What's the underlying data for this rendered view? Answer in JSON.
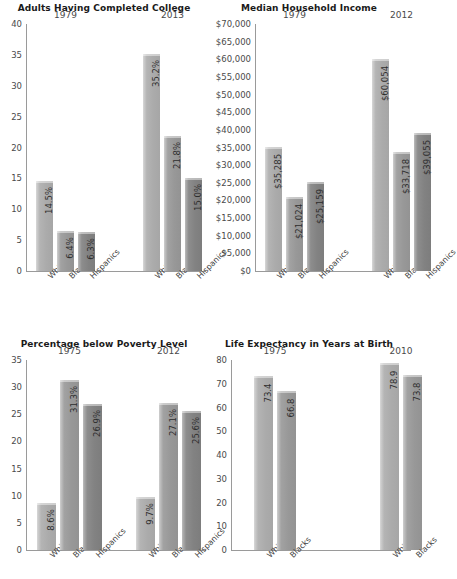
{
  "figure": {
    "background": "#ffffff",
    "series_colors": {
      "Whites": "#b4b4b4",
      "Blacks": "#a2a2a2",
      "Hispanics": "#8d8d8d"
    }
  },
  "chart_data": [
    {
      "type": "bar",
      "title": "Adults Having Completed College",
      "xlabel": "",
      "ylabel": "",
      "ylim": [
        0,
        40
      ],
      "yticks": [
        "0",
        "5",
        "10",
        "15",
        "20",
        "25",
        "30",
        "35",
        "40"
      ],
      "ytick_values": [
        0,
        5,
        10,
        15,
        20,
        25,
        30,
        35,
        40
      ],
      "grid": false,
      "legend": "none",
      "groups": [
        "1979",
        "2013"
      ],
      "categories": [
        "Whites",
        "Blacks",
        "Hispanics"
      ],
      "series": [
        {
          "name": "1979",
          "values": [
            14.5,
            6.4,
            6.3
          ],
          "labels": [
            "14.5%",
            "6.4%",
            "6.3%"
          ]
        },
        {
          "name": "2013",
          "values": [
            35.2,
            21.8,
            15.0
          ],
          "labels": [
            "35.2%",
            "21.8%",
            "15.0%"
          ]
        }
      ]
    },
    {
      "type": "bar",
      "title": "Median Household Income",
      "xlabel": "",
      "ylabel": "",
      "ylim": [
        0,
        70000
      ],
      "yticks": [
        "$0",
        "$5,000",
        "$10,000",
        "$15,000",
        "$20,000",
        "$25,000",
        "$30,000",
        "$35,000",
        "$40,000",
        "$45,000",
        "$50,000",
        "$55,000",
        "$60,000",
        "$65,000",
        "$70,000"
      ],
      "ytick_values": [
        0,
        5000,
        10000,
        15000,
        20000,
        25000,
        30000,
        35000,
        40000,
        45000,
        50000,
        55000,
        60000,
        65000,
        70000
      ],
      "grid": false,
      "legend": "none",
      "groups": [
        "1979",
        "2012"
      ],
      "categories": [
        "Whites",
        "Blacks",
        "Hispanics"
      ],
      "series": [
        {
          "name": "1979",
          "values": [
            35285,
            21024,
            25159
          ],
          "labels": [
            "$35,285",
            "$21,024",
            "$25,159"
          ]
        },
        {
          "name": "2012",
          "values": [
            60054,
            33718,
            39055
          ],
          "labels": [
            "$60,054",
            "$33,718",
            "$39,055"
          ]
        }
      ]
    },
    {
      "type": "bar",
      "title": "Percentage below Poverty Level",
      "xlabel": "",
      "ylabel": "",
      "ylim": [
        0,
        35
      ],
      "yticks": [
        "0",
        "5",
        "10",
        "15",
        "20",
        "25",
        "30",
        "35"
      ],
      "ytick_values": [
        0,
        5,
        10,
        15,
        20,
        25,
        30,
        35
      ],
      "grid": false,
      "legend": "none",
      "groups": [
        "1975",
        "2012"
      ],
      "categories": [
        "Whites",
        "Blacks",
        "Hispanics"
      ],
      "series": [
        {
          "name": "1975",
          "values": [
            8.6,
            31.3,
            26.9
          ],
          "labels": [
            "8.6%",
            "31.3%",
            "26.9%"
          ]
        },
        {
          "name": "2012",
          "values": [
            9.7,
            27.1,
            25.6
          ],
          "labels": [
            "9.7%",
            "27.1%",
            "25.6%"
          ]
        }
      ]
    },
    {
      "type": "bar",
      "title": "Life Expectancy in Years at Birth",
      "xlabel": "",
      "ylabel": "",
      "ylim": [
        0,
        80
      ],
      "yticks": [
        "0",
        "10",
        "20",
        "30",
        "40",
        "50",
        "60",
        "70",
        "80"
      ],
      "ytick_values": [
        0,
        10,
        20,
        30,
        40,
        50,
        60,
        70,
        80
      ],
      "grid": false,
      "legend": "none",
      "groups": [
        "1975",
        "2010"
      ],
      "categories": [
        "Whites",
        "Blacks"
      ],
      "series": [
        {
          "name": "1975",
          "values": [
            73.4,
            66.8
          ],
          "labels": [
            "73.4",
            "66.8"
          ]
        },
        {
          "name": "2010",
          "values": [
            78.9,
            73.8
          ],
          "labels": [
            "78.9",
            "73.8"
          ]
        }
      ]
    }
  ]
}
